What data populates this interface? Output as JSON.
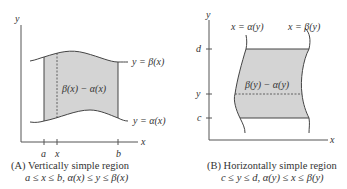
{
  "panel_a": {
    "axis_y": "y",
    "axis_x": "x",
    "upper_curve": "y = β(x)",
    "lower_curve": "y = α(x)",
    "region_label": "β(x) − α(x)",
    "tick_labels": [
      "a",
      "x",
      "b"
    ],
    "caption_title": "(A) Vertically simple region",
    "caption_condition": "a ≤ x ≤ b,  α(x) ≤ y ≤ β(x)"
  },
  "panel_b": {
    "axis_y": "y",
    "axis_x": "x",
    "left_curve": "x = α(y)",
    "right_curve": "x = β(y)",
    "region_label": "β(y) − α(y)",
    "tick_labels": [
      "d",
      "y",
      "c"
    ],
    "caption_title": "(B) Horizontally simple region",
    "caption_condition": "c ≤ y ≤ d,  α(y) ≤ x ≤ β(y)"
  },
  "colors": {
    "region_fill": "#d4d4d4",
    "line": "#444444"
  }
}
